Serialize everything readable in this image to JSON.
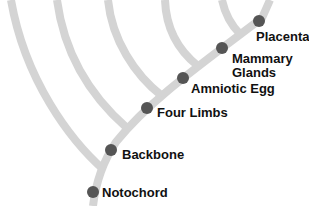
{
  "diagram": {
    "type": "cladogram",
    "colors": {
      "branch": "#d4d4d4",
      "node": "#555555",
      "text": "#111111",
      "background": "#ffffff"
    },
    "traits": [
      {
        "label": "Notochord",
        "x": 93,
        "y": 192
      },
      {
        "label": "Backbone",
        "x": 111,
        "y": 150
      },
      {
        "label": "Four Limbs",
        "x": 147,
        "y": 108
      },
      {
        "label": "Amniotic Egg",
        "x": 183,
        "y": 78
      },
      {
        "label": "Mammary Glands",
        "line1": "Mammary",
        "line2": "Glands",
        "x": 222,
        "y": 48
      },
      {
        "label": "Placenta",
        "x": 259,
        "y": 21
      }
    ]
  }
}
